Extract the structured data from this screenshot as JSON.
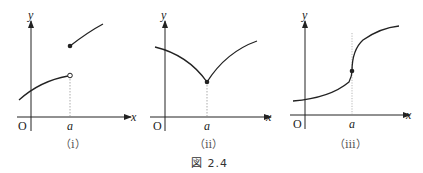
{
  "figure_caption": "図 2.4",
  "panels": [
    {
      "id": "i",
      "caption": "（ⅰ）",
      "axis_x_label": "x",
      "axis_y_label": "y",
      "origin_label": "O",
      "tick_label": "a",
      "description": "jump discontinuity at a: open circle on lower branch end, filled dot starting upper branch"
    },
    {
      "id": "ii",
      "caption": "（ⅱ）",
      "axis_x_label": "x",
      "axis_y_label": "y",
      "origin_label": "O",
      "tick_label": "a",
      "description": "cusp at a: continuous but not differentiable, filled dot at minimum"
    },
    {
      "id": "iii",
      "caption": "（ⅲ）",
      "axis_x_label": "x",
      "axis_y_label": "y",
      "origin_label": "O",
      "tick_label": "a",
      "description": "vertical tangent at a: continuous, filled dot at inflection point"
    }
  ],
  "colors": {
    "ink": "#222222",
    "guide": "#888888"
  }
}
